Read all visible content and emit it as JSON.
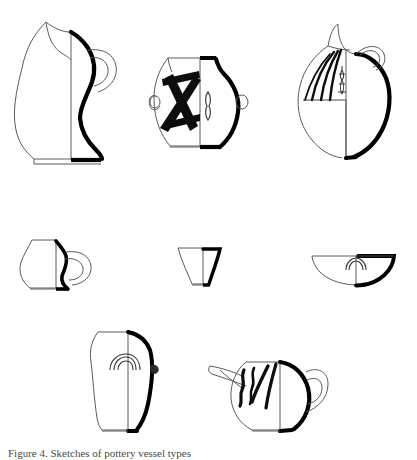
{
  "plate": {
    "background_color": "#ffffff",
    "ink_color": "#000000",
    "thin_line_color": "#5a5a5a",
    "caption_text": "Figure 4. Sketches of pottery vessel types"
  },
  "vessels": [
    {
      "id": "vessel-1",
      "name": "trefoil-mouth-pitcher",
      "row": 1,
      "column": 1,
      "label": "Trefoil-mouth pitcher with strap handle",
      "decoration": "none"
    },
    {
      "id": "vessel-2",
      "name": "lug-handled-jar-with-cross-motif",
      "row": 1,
      "column": 2,
      "label": "Ovoid jar with two horizontal lug handles",
      "decoration": "bold cross / X motif with central vertical band"
    },
    {
      "id": "vessel-3",
      "name": "beak-spouted-jug",
      "row": 1,
      "column": 3,
      "label": "Round-bodied beak-spouted jug with shoulder handle",
      "decoration": "vertical radiating stripes with central figure motif"
    },
    {
      "id": "vessel-4",
      "name": "one-handled-cup",
      "row": 2,
      "column": 1,
      "label": "Small one-handled cup",
      "decoration": "none"
    },
    {
      "id": "vessel-5",
      "name": "conical-beaker",
      "row": 2,
      "column": 2,
      "label": "Flaring conical beaker",
      "decoration": "none"
    },
    {
      "id": "vessel-6",
      "name": "hemispherical-bowl",
      "row": 2,
      "column": 3,
      "label": "Shallow hemispherical bowl",
      "decoration": "concentric pendant arcs below rim"
    },
    {
      "id": "vessel-7",
      "name": "tall-ovoid-jar",
      "row": 3,
      "column": 1,
      "label": "Tall ovoid jar with small side lug",
      "decoration": "concentric semicircular arcs on shoulder"
    },
    {
      "id": "vessel-8",
      "name": "spouted-teapot-vessel",
      "row": 3,
      "column": 2,
      "label": "Squat spouted vessel with side handle",
      "decoration": "vertical zigzag and wavy bands"
    }
  ]
}
